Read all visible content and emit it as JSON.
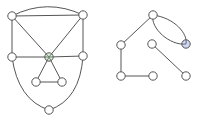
{
  "diagram": {
    "type": "graph",
    "graphs": [
      {
        "name": "graph-left",
        "nodes": [
          {
            "id": "A",
            "label": "",
            "highlight": null
          },
          {
            "id": "B",
            "label": "",
            "highlight": null
          },
          {
            "id": "C",
            "label": "",
            "highlight": null
          },
          {
            "id": "D",
            "label": "",
            "highlight": "#9ad49a"
          },
          {
            "id": "E",
            "label": "",
            "highlight": null
          },
          {
            "id": "F",
            "label": "",
            "highlight": null
          },
          {
            "id": "G",
            "label": "",
            "highlight": null
          },
          {
            "id": "H",
            "label": "",
            "highlight": null
          }
        ],
        "edges": [
          {
            "from": "A",
            "to": "B",
            "curved": false
          },
          {
            "from": "A",
            "to": "B",
            "curved": true
          },
          {
            "from": "A",
            "to": "C",
            "curved": false
          },
          {
            "from": "A",
            "to": "D",
            "curved": false
          },
          {
            "from": "B",
            "to": "D",
            "curved": false
          },
          {
            "from": "B",
            "to": "E",
            "curved": false
          },
          {
            "from": "C",
            "to": "D",
            "curved": false
          },
          {
            "from": "D",
            "to": "E",
            "curved": false
          },
          {
            "from": "D",
            "to": "F",
            "curved": false
          },
          {
            "from": "D",
            "to": "G",
            "curved": false
          },
          {
            "from": "F",
            "to": "G",
            "curved": false
          },
          {
            "from": "C",
            "to": "H",
            "curved": true
          },
          {
            "from": "E",
            "to": "H",
            "curved": true
          }
        ]
      },
      {
        "name": "graph-right",
        "nodes": [
          {
            "id": "P",
            "label": "",
            "highlight": null
          },
          {
            "id": "Q",
            "label": "",
            "highlight": null
          },
          {
            "id": "R",
            "label": "",
            "highlight": null
          },
          {
            "id": "S",
            "label": "",
            "highlight": null
          },
          {
            "id": "T",
            "label": "",
            "highlight": "#7f8fd4"
          },
          {
            "id": "U",
            "label": "",
            "highlight": null
          },
          {
            "id": "V",
            "label": "",
            "highlight": null
          }
        ],
        "edges": [
          {
            "from": "P",
            "to": "Q",
            "curved": false
          },
          {
            "from": "Q",
            "to": "R",
            "curved": false
          },
          {
            "from": "R",
            "to": "S",
            "curved": false
          },
          {
            "from": "P",
            "to": "T",
            "curved": true
          },
          {
            "from": "P",
            "to": "T",
            "curved": true
          },
          {
            "from": "U",
            "to": "V",
            "curved": false
          }
        ]
      }
    ]
  }
}
